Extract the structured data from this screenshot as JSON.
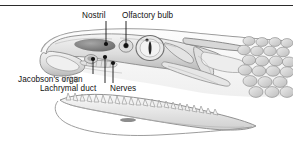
{
  "figure": {
    "title": "",
    "rule_color": "#2b2b2b",
    "background": "#ffffff",
    "ink_color": "#111111",
    "labels": [
      {
        "id": "nostril",
        "text": "Nostril",
        "x": 82,
        "y": 11
      },
      {
        "id": "olfactory",
        "text": "Olfactory bulb",
        "x": 122,
        "y": 11
      },
      {
        "id": "jacobsons",
        "text": "Jacobson's organ",
        "x": 18,
        "y": 75
      },
      {
        "id": "lachrymal",
        "text": "Lachrymal duct",
        "x": 40,
        "y": 84
      },
      {
        "id": "nerves",
        "text": "Nerves",
        "x": 110,
        "y": 84
      }
    ],
    "leaders": [
      {
        "id": "nostril",
        "from": [
          106,
          21
        ],
        "to": [
          106,
          44
        ]
      },
      {
        "id": "olfactory",
        "from": [
          126,
          21
        ],
        "to": [
          126,
          45
        ]
      },
      {
        "id": "jacobsons",
        "from": [
          93,
          74
        ],
        "to": [
          93,
          59
        ]
      },
      {
        "id": "lachrymal",
        "from": [
          105,
          83
        ],
        "to": [
          105,
          58
        ]
      },
      {
        "id": "nerves",
        "from": [
          113,
          83
        ],
        "to": [
          113,
          63
        ]
      }
    ],
    "callout_points": [
      {
        "id": "nostril-point",
        "x": 106,
        "y": 44
      },
      {
        "id": "olfactory-point",
        "x": 126,
        "y": 45
      },
      {
        "id": "jacobsons-point",
        "x": 93,
        "y": 59
      },
      {
        "id": "lachrymal-point",
        "x": 105,
        "y": 57
      },
      {
        "id": "nerves-point",
        "x": 113,
        "y": 63
      }
    ]
  }
}
